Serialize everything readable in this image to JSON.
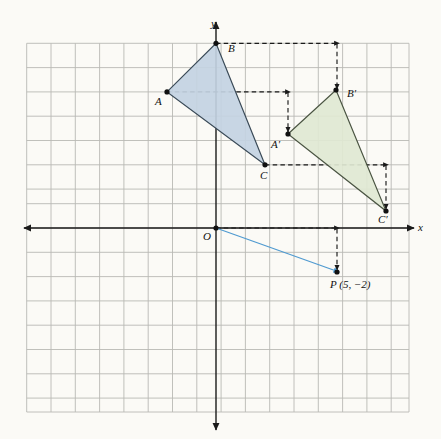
{
  "figure": {
    "background_color": "#fbfaf6",
    "grid": {
      "color": "#b9b9b4",
      "cell_px": 24.3,
      "x_min": -7.8,
      "x_max": 7.9,
      "y_min": -7.7,
      "y_max": 7.6,
      "origin_px": {
        "x": 216,
        "y": 228
      },
      "visible": true
    },
    "axes": {
      "color": "#1a1a1a",
      "x_label": "x",
      "y_label": "y",
      "origin_label": "O"
    },
    "triangles": [
      {
        "name": "ABC",
        "fill": "#c3d3e2",
        "stroke": "#3a4a57",
        "vertices": [
          {
            "label": "A",
            "x": -2,
            "y": 5.7
          },
          {
            "label": "B",
            "x": 0,
            "y": 7.6
          },
          {
            "label": "C",
            "x": 2,
            "y": 2.6
          }
        ]
      },
      {
        "name": "A'B'C'",
        "fill": "#dde6d2",
        "stroke": "#4a5442",
        "vertices": [
          {
            "label": "A'",
            "x": 3,
            "y": 3.7
          },
          {
            "label": "B'",
            "x": 5,
            "y": 5.6
          },
          {
            "label": "C'",
            "x": 7,
            "y": 0.6
          }
        ]
      }
    ],
    "vector": {
      "label": "P (5, −2)",
      "point_label": "P",
      "from": {
        "x": 0,
        "y": 0
      },
      "to": {
        "x": 5,
        "y": -2
      },
      "color": "#4f9ad0",
      "components": {
        "dx": 5,
        "dy": -2
      }
    },
    "translation_arrows": [
      {
        "name": "arrow-A",
        "from": {
          "x": -2,
          "y": 5.7
        },
        "to": {
          "x": 3,
          "y": 5.7
        },
        "then_to": {
          "x": 3,
          "y": 3.7
        }
      },
      {
        "name": "arrow-B",
        "from": {
          "x": 0,
          "y": 7.6
        },
        "to": {
          "x": 5,
          "y": 7.6
        },
        "then_to": {
          "x": 5,
          "y": 5.6
        }
      },
      {
        "name": "arrow-C",
        "from": {
          "x": 2,
          "y": 2.6
        },
        "to": {
          "x": 7,
          "y": 2.6
        },
        "then_to": {
          "x": 7,
          "y": 0.6
        }
      },
      {
        "name": "arrow-O",
        "from": {
          "x": 0,
          "y": 0
        },
        "to": {
          "x": 5,
          "y": 0
        },
        "then_to": {
          "x": 5,
          "y": -2
        }
      }
    ],
    "dashed_color": "#1a1a1a",
    "labels": {
      "A": "A",
      "B": "B",
      "C": "C",
      "A_prime": "A′",
      "B_prime": "B′",
      "C_prime": "C′",
      "O": "O",
      "x_axis": "x",
      "y_axis": "y",
      "P": "P (5, −2)"
    }
  }
}
